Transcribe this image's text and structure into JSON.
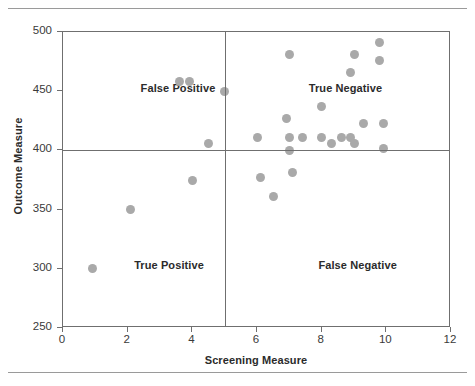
{
  "figure": {
    "y_axis_title": "Outcome Measure",
    "x_axis_title": "Screening Measure"
  },
  "quadrants": [
    {
      "name": "false-positive",
      "label": "False Positive"
    },
    {
      "name": "true-negative",
      "label": "True Negative"
    },
    {
      "name": "true-positive",
      "label": "True Positive"
    },
    {
      "name": "false-negative",
      "label": "False Negative"
    }
  ],
  "chart_data": {
    "type": "scatter",
    "title": "",
    "xlabel": "Screening Measure",
    "ylabel": "Outcome Measure",
    "xlim": [
      0,
      12
    ],
    "ylim": [
      250,
      500
    ],
    "xticks": [
      0,
      2,
      4,
      6,
      8,
      10,
      12
    ],
    "yticks": [
      250,
      300,
      350,
      400,
      450,
      500
    ],
    "grid": false,
    "legend": null,
    "marker_color": "#a9a9a9",
    "reference_lines": {
      "vertical_x": 5,
      "horizontal_y": 400
    },
    "quadrant_annotations": [
      {
        "text": "False Positive",
        "x": 2.4,
        "y": 452
      },
      {
        "text": "True Negative",
        "x": 7.6,
        "y": 452
      },
      {
        "text": "True Positive",
        "x": 2.2,
        "y": 302
      },
      {
        "text": "False Negative",
        "x": 7.9,
        "y": 302
      }
    ],
    "points": [
      {
        "x": 0.9,
        "y": 300
      },
      {
        "x": 2.1,
        "y": 350
      },
      {
        "x": 3.6,
        "y": 458
      },
      {
        "x": 3.9,
        "y": 458
      },
      {
        "x": 4.0,
        "y": 375
      },
      {
        "x": 4.5,
        "y": 406
      },
      {
        "x": 5.0,
        "y": 450
      },
      {
        "x": 6.0,
        "y": 411
      },
      {
        "x": 6.1,
        "y": 377
      },
      {
        "x": 6.5,
        "y": 361
      },
      {
        "x": 6.9,
        "y": 427
      },
      {
        "x": 7.0,
        "y": 481
      },
      {
        "x": 7.0,
        "y": 411
      },
      {
        "x": 7.0,
        "y": 400
      },
      {
        "x": 7.1,
        "y": 381
      },
      {
        "x": 7.4,
        "y": 411
      },
      {
        "x": 8.0,
        "y": 437
      },
      {
        "x": 8.0,
        "y": 411
      },
      {
        "x": 8.3,
        "y": 406
      },
      {
        "x": 8.6,
        "y": 411
      },
      {
        "x": 8.9,
        "y": 466
      },
      {
        "x": 8.9,
        "y": 411
      },
      {
        "x": 9.0,
        "y": 481
      },
      {
        "x": 9.0,
        "y": 406
      },
      {
        "x": 9.3,
        "y": 423
      },
      {
        "x": 9.8,
        "y": 491
      },
      {
        "x": 9.8,
        "y": 476
      },
      {
        "x": 9.9,
        "y": 423
      },
      {
        "x": 9.9,
        "y": 402
      }
    ]
  }
}
